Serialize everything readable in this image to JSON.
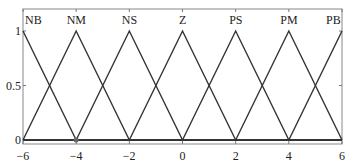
{
  "chart_data": {
    "type": "line",
    "title": "",
    "xlabel": "",
    "ylabel": "",
    "xlim": [
      -6,
      6
    ],
    "ylim": [
      0,
      1
    ],
    "grid": false,
    "x_ticks": [
      "-6",
      "-4",
      "-2",
      "0",
      "2",
      "4",
      "6"
    ],
    "y_ticks": [
      "0",
      "0.5",
      "1"
    ],
    "line_color": "#333333",
    "series": [
      {
        "name": "NB",
        "x": [
          -6,
          -4
        ],
        "values": [
          1,
          0
        ]
      },
      {
        "name": "NM",
        "x": [
          -6,
          -4,
          -2
        ],
        "values": [
          0,
          1,
          0
        ]
      },
      {
        "name": "NS",
        "x": [
          -4,
          -2,
          0
        ],
        "values": [
          0,
          1,
          0
        ]
      },
      {
        "name": "Z",
        "x": [
          -2,
          0,
          2
        ],
        "values": [
          0,
          1,
          0
        ]
      },
      {
        "name": "PS",
        "x": [
          0,
          2,
          4
        ],
        "values": [
          0,
          1,
          0
        ]
      },
      {
        "name": "PM",
        "x": [
          2,
          4,
          6
        ],
        "values": [
          0,
          1,
          0
        ]
      },
      {
        "name": "PB",
        "x": [
          4,
          6
        ],
        "values": [
          0,
          1
        ]
      }
    ],
    "annotations": [
      "NB",
      "NM",
      "NS",
      "Z",
      "PS",
      "PM",
      "PB"
    ]
  }
}
